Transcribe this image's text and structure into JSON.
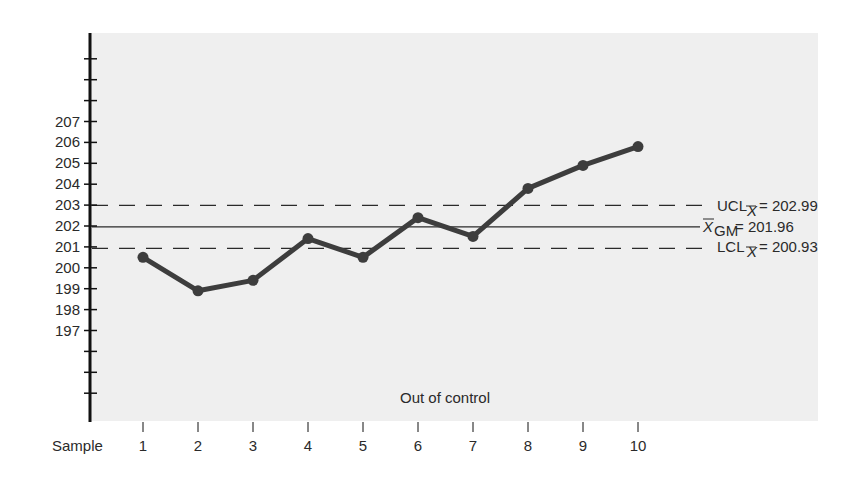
{
  "chart_data": {
    "type": "line",
    "title": "",
    "xlabel": "Sample",
    "ylabel": "",
    "x": [
      1,
      2,
      3,
      4,
      5,
      6,
      7,
      8,
      9,
      10
    ],
    "series": [
      {
        "name": "Sample mean",
        "values": [
          200.5,
          198.9,
          199.4,
          201.4,
          200.5,
          202.4,
          201.5,
          203.8,
          204.9,
          205.8
        ]
      }
    ],
    "yticks": [
      197,
      198,
      199,
      200,
      201,
      202,
      203,
      204,
      205,
      206,
      207
    ],
    "unlabeled_yticks_above": 3,
    "unlabeled_yticks_below": 3,
    "ylim": [
      193.5,
      211.3
    ],
    "reference_lines": [
      {
        "name": "UCL",
        "label_main": "UCL",
        "label_sub": "X̄",
        "value": 202.99,
        "style": "dashed"
      },
      {
        "name": "Grand mean",
        "label_main": "X̄",
        "label_sub": "GM",
        "value": 201.96,
        "style": "solid"
      },
      {
        "name": "LCL",
        "label_main": "LCL",
        "label_sub": "X̄",
        "value": 200.93,
        "style": "dashed"
      }
    ],
    "annotations": [
      "Out of control"
    ],
    "grid": false,
    "legend": null
  },
  "labels": {
    "x_axis": "Sample",
    "annotation": "Out of control",
    "ucl_text": "= 202.99",
    "gm_text": "= 201.96",
    "lcl_text": "= 200.93"
  },
  "colors": {
    "plot_bg": "#efefef",
    "line": "#3d3d3d",
    "axis": "#111111",
    "text": "#2a2a2a"
  }
}
